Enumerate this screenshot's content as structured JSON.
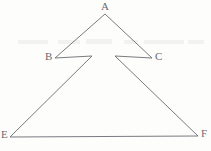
{
  "figure": {
    "type": "line-drawing",
    "stroke_color": "#6b6b72",
    "background_color": "#fdfdfc",
    "stroke_width": 0.9,
    "width": 211,
    "height": 151,
    "vertices": [
      {
        "id": "A",
        "label": "A",
        "x": 105,
        "y": 14,
        "label_x": 101,
        "label_y": 1
      },
      {
        "id": "B",
        "label": "B",
        "x": 55,
        "y": 58,
        "label_x": 45,
        "label_y": 51
      },
      {
        "id": "C",
        "label": "C",
        "x": 152,
        "y": 58,
        "label_x": 155,
        "label_y": 51
      },
      {
        "id": "E",
        "label": "E",
        "x": 10,
        "y": 137,
        "label_x": 1,
        "label_y": 129
      },
      {
        "id": "F",
        "label": "F",
        "x": 198,
        "y": 136,
        "label_x": 201,
        "label_y": 128
      }
    ],
    "interior_corners": [
      {
        "id": "left-notch",
        "x": 92,
        "y": 56
      },
      {
        "id": "right-notch",
        "x": 115,
        "y": 56
      }
    ],
    "outline_path": "M 105 14 L 55 58 L 92 56 L 10 137 L 198 136 L 115 56 L 152 58 Z",
    "segments": [
      {
        "from": "A",
        "to": "B",
        "name": "segment-a-b"
      },
      {
        "from": "B",
        "to": "left-notch",
        "name": "segment-b-left-notch"
      },
      {
        "from": "left-notch",
        "to": "E",
        "name": "segment-left-notch-e"
      },
      {
        "from": "E",
        "to": "F",
        "name": "segment-e-f"
      },
      {
        "from": "F",
        "to": "right-notch",
        "name": "segment-f-right-notch"
      },
      {
        "from": "right-notch",
        "to": "C",
        "name": "segment-right-notch-c"
      },
      {
        "from": "C",
        "to": "A",
        "name": "segment-c-a"
      }
    ]
  },
  "artifacts": [
    {
      "x": 18,
      "y": 40,
      "w": 30,
      "h": 4
    },
    {
      "x": 58,
      "y": 40,
      "w": 22,
      "h": 4
    },
    {
      "x": 86,
      "y": 39,
      "w": 26,
      "h": 5
    },
    {
      "x": 124,
      "y": 40,
      "w": 14,
      "h": 4
    },
    {
      "x": 144,
      "y": 40,
      "w": 40,
      "h": 4
    },
    {
      "x": 188,
      "y": 40,
      "w": 16,
      "h": 4
    }
  ]
}
